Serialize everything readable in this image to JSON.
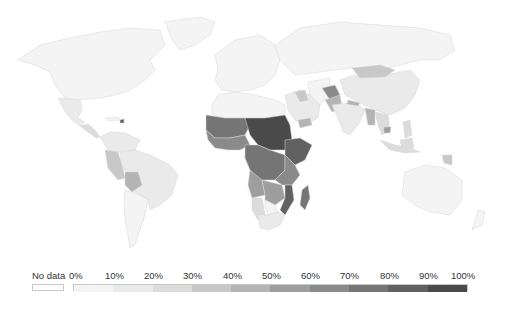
{
  "legend": {
    "no_data_label": "No data",
    "no_data_color": "#ffffff",
    "ticks": [
      "0%",
      "10%",
      "20%",
      "30%",
      "40%",
      "50%",
      "60%",
      "70%",
      "80%",
      "90%",
      "100%"
    ],
    "bins": [
      {
        "range": "0-10%",
        "color": "#f4f4f4"
      },
      {
        "range": "10-20%",
        "color": "#eaeaea"
      },
      {
        "range": "20-30%",
        "color": "#dcdcdc"
      },
      {
        "range": "30-40%",
        "color": "#c8c8c8"
      },
      {
        "range": "40-50%",
        "color": "#b4b4b4"
      },
      {
        "range": "50-60%",
        "color": "#9e9e9e"
      },
      {
        "range": "60-70%",
        "color": "#8a8a8a"
      },
      {
        "range": "70-80%",
        "color": "#757575"
      },
      {
        "range": "80-90%",
        "color": "#616161"
      },
      {
        "range": "90-100%",
        "color": "#4a4a4a"
      }
    ]
  },
  "map": {
    "type": "choropleth",
    "projection": "world",
    "regions": [
      {
        "name": "North America",
        "bin": "0-10%"
      },
      {
        "name": "Greenland",
        "bin": "0-10%"
      },
      {
        "name": "Mexico",
        "bin": "10-20%"
      },
      {
        "name": "Central America",
        "bin": "20-30%"
      },
      {
        "name": "Haiti",
        "bin": "80-90%"
      },
      {
        "name": "Colombia/Venezuela",
        "bin": "10-20%"
      },
      {
        "name": "Brazil",
        "bin": "10-20%"
      },
      {
        "name": "Peru",
        "bin": "30-40%"
      },
      {
        "name": "Bolivia",
        "bin": "40-50%"
      },
      {
        "name": "Argentina/Chile",
        "bin": "0-10%"
      },
      {
        "name": "Europe",
        "bin": "0-10%"
      },
      {
        "name": "Russia",
        "bin": "0-10%"
      },
      {
        "name": "North Africa",
        "bin": "0-10%"
      },
      {
        "name": "Sahel West",
        "bin": "70-80%"
      },
      {
        "name": "Chad/Sudan",
        "bin": "90-100%"
      },
      {
        "name": "Ethiopia",
        "bin": "80-90%"
      },
      {
        "name": "West Africa coast",
        "bin": "60-70%"
      },
      {
        "name": "Central Africa",
        "bin": "70-80%"
      },
      {
        "name": "East Africa",
        "bin": "60-70%"
      },
      {
        "name": "Angola",
        "bin": "50-60%"
      },
      {
        "name": "Zambia/Zimbabwe",
        "bin": "50-60%"
      },
      {
        "name": "Mozambique",
        "bin": "80-90%"
      },
      {
        "name": "Madagascar",
        "bin": "70-80%"
      },
      {
        "name": "Namibia",
        "bin": "20-30%"
      },
      {
        "name": "Botswana",
        "bin": "0-10%"
      },
      {
        "name": "South Africa",
        "bin": "10-20%"
      },
      {
        "name": "Middle East",
        "bin": "10-20%"
      },
      {
        "name": "Iraq",
        "bin": "30-40%"
      },
      {
        "name": "Yemen",
        "bin": "40-50%"
      },
      {
        "name": "Afghanistan",
        "bin": "60-70%"
      },
      {
        "name": "Pakistan",
        "bin": "40-50%"
      },
      {
        "name": "India",
        "bin": "10-20%"
      },
      {
        "name": "Nepal",
        "bin": "40-50%"
      },
      {
        "name": "Myanmar",
        "bin": "40-50%"
      },
      {
        "name": "China",
        "bin": "10-20%"
      },
      {
        "name": "Mongolia",
        "bin": "30-40%"
      },
      {
        "name": "Cambodia",
        "bin": "50-60%"
      },
      {
        "name": "Indonesia",
        "bin": "20-30%"
      },
      {
        "name": "Philippines",
        "bin": "20-30%"
      },
      {
        "name": "Papua New Guinea",
        "bin": "30-40%"
      },
      {
        "name": "Australia",
        "bin": "0-10%"
      },
      {
        "name": "New Zealand",
        "bin": "0-10%"
      }
    ]
  }
}
